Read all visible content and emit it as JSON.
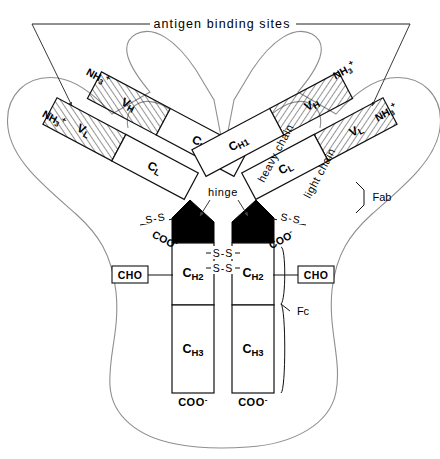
{
  "figure": {
    "title": "antigen binding sites",
    "type": "antibody-igg-schematic",
    "background_color": "#ffffff",
    "line_color": "#111111",
    "outline_color": "#8a8a8a",
    "fill_hinge_color": "#000000"
  },
  "callouts": {
    "antigen_binding_sites": "antigen binding sites",
    "hinge": "hinge",
    "heavy_chain": "heavy chain",
    "light_chain": "light chain",
    "fab": "Fab",
    "fc": "Fc"
  },
  "domains": {
    "left_light": [
      {
        "name": "VL",
        "label": "VL",
        "hatched": true
      },
      {
        "name": "CL",
        "label": "CL",
        "hatched": false
      }
    ],
    "left_heavy": [
      {
        "name": "VH",
        "label": "VH",
        "hatched": true
      },
      {
        "name": "CH1",
        "label": "CH1",
        "hatched": false
      },
      {
        "name": "CH2",
        "label": "CH2",
        "hatched": false
      },
      {
        "name": "CH3",
        "label": "CH3",
        "hatched": false
      }
    ],
    "right_heavy": [
      {
        "name": "VH",
        "label": "VH",
        "hatched": true
      },
      {
        "name": "CH1",
        "label": "CH1",
        "hatched": false
      },
      {
        "name": "CH2",
        "label": "CH2",
        "hatched": false
      },
      {
        "name": "CH3",
        "label": "CH3",
        "hatched": false
      }
    ],
    "right_light": [
      {
        "name": "VL",
        "label": "VL",
        "hatched": true
      },
      {
        "name": "CL",
        "label": "CL",
        "hatched": false
      }
    ]
  },
  "termini": {
    "amino": "NH",
    "amino_sub": "3",
    "amino_sup": "+",
    "carboxyl": "COO",
    "carboxyl_sup": "-",
    "count_amino": 4,
    "count_carboxyl": 4
  },
  "bonds": {
    "disulfide_label": "S-S",
    "interchain_hinge_count": 2,
    "heavy_light_count": 2
  },
  "carbohydrate": {
    "label": "CHO",
    "count": 2
  },
  "domain_subscripts": {
    "CH1": {
      "base": "C",
      "sub": "H",
      "num": "1"
    },
    "CH2": {
      "base": "C",
      "sub": "H",
      "num": "2"
    },
    "CH3": {
      "base": "C",
      "sub": "H",
      "num": "3"
    },
    "CL": {
      "base": "C",
      "sub": "L"
    },
    "VL": {
      "base": "V",
      "sub": "L"
    },
    "VH": {
      "base": "V",
      "sub": "H"
    }
  }
}
